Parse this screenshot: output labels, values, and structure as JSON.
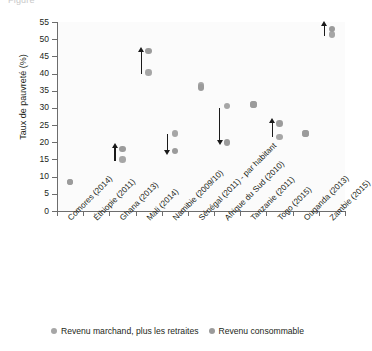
{
  "top_caption_remnant": "Figure",
  "chart_data": {
    "type": "scatter",
    "title": "",
    "xlabel": "",
    "ylabel": "Taux de pauvreté (%)",
    "ylim": [
      0,
      55
    ],
    "yticks": [
      0,
      5,
      10,
      15,
      20,
      25,
      30,
      35,
      40,
      45,
      50,
      55
    ],
    "grid": false,
    "legend_position": "bottom",
    "categories": [
      "Comores (2014)",
      "Éthiopie (2011)",
      "Ghana (2013)",
      "Mali (2014)",
      "Namibie (2009/10)",
      "Sénégal (2011) - par habitant",
      "Afrique du Sud (2010)",
      "Tanzanie (2011)",
      "Togo (2015)",
      "Ouganda (2013)",
      "Zambie (2015)"
    ],
    "series": [
      {
        "name": "Revenu marchand, plus les retraites",
        "color": "#a6a6a6",
        "values": [
          8.5,
          null,
          15.0,
          40.3,
          22.5,
          36.5,
          30.5,
          31.0,
          21.5,
          22.5,
          51.3
        ]
      },
      {
        "name": "Revenu consommable",
        "color": "#9b9b9b",
        "values": [
          8.5,
          null,
          18.0,
          46.5,
          17.5,
          36.0,
          20.0,
          31.0,
          25.5,
          22.5,
          53.0
        ]
      }
    ],
    "annotations": [
      {
        "category": "Ghana (2013)",
        "type": "arrow",
        "direction": "up",
        "from": 14.5,
        "to": 18.5
      },
      {
        "category": "Mali (2014)",
        "type": "arrow",
        "direction": "up",
        "from": 40.0,
        "to": 46.5
      },
      {
        "category": "Namibie (2009/10)",
        "type": "arrow",
        "direction": "down",
        "from": 22.5,
        "to": 17.5
      },
      {
        "category": "Afrique du Sud (2010)",
        "type": "arrow",
        "direction": "down",
        "from": 30.0,
        "to": 20.5
      },
      {
        "category": "Togo (2015)",
        "type": "arrow",
        "direction": "up",
        "from": 21.5,
        "to": 26.0
      },
      {
        "category": "Zambie (2015)",
        "type": "arrow",
        "direction": "up",
        "from": 51.0,
        "to": 54.0
      }
    ]
  },
  "legend": {
    "items": [
      {
        "label": "Revenu marchand, plus les retraites",
        "color": "#a6a6a6"
      },
      {
        "label": "Revenu consommable",
        "color": "#9b9b9b"
      }
    ]
  }
}
